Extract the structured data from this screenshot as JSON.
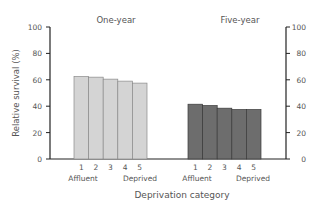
{
  "chart_data": {
    "type": "bar",
    "title": "",
    "xlabel": "Deprivation category",
    "ylabel": "Relative survival (%)",
    "ylim": [
      0,
      100
    ],
    "yticks": [
      0,
      20,
      40,
      60,
      80,
      100
    ],
    "categories": [
      "1",
      "2",
      "3",
      "4",
      "5"
    ],
    "category_end_labels": {
      "left": "Affluent",
      "right": "Deprived"
    },
    "grid": false,
    "groups": [
      {
        "name": "One-year",
        "color": "#d4d4d4",
        "values": [
          62.5,
          62,
          60.5,
          59,
          57.5
        ]
      },
      {
        "name": "Five-year",
        "color": "#6d6d6d",
        "values": [
          41.5,
          40.5,
          38.5,
          37.5,
          37.5
        ]
      }
    ]
  }
}
